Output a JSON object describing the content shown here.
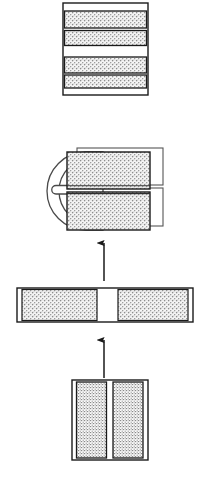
{
  "figure": {
    "background_color": "#ffffff",
    "line_color": "#1a1a1a",
    "hatch_color": "#9a9a9a",
    "fill_white": "#ffffff",
    "canvas": {
      "width": 208,
      "height": 492
    },
    "stages": [
      {
        "id": "stage-4-final-laminate",
        "order": 4,
        "name": "final-stacked-laminate",
        "position_label": "top",
        "shape": "rectangle",
        "x": 63,
        "y": 3,
        "width": 85,
        "height": 92,
        "bands": [
          {
            "name": "margin-top",
            "fill": "white",
            "y": 3,
            "height": 8
          },
          {
            "name": "hatched-band-1",
            "fill": "hatch",
            "y": 11,
            "height": 17
          },
          {
            "name": "divider-1",
            "fill": "line",
            "y": 28,
            "height": 2
          },
          {
            "name": "hatched-band-2",
            "fill": "hatch",
            "y": 30,
            "height": 15
          },
          {
            "name": "center-gap",
            "fill": "white",
            "y": 45,
            "height": 12
          },
          {
            "name": "hatched-band-3",
            "fill": "hatch",
            "y": 57,
            "height": 16
          },
          {
            "name": "divider-2",
            "fill": "line",
            "y": 73,
            "height": 2
          },
          {
            "name": "hatched-band-4",
            "fill": "hatch",
            "y": 75,
            "height": 13
          },
          {
            "name": "margin-bottom",
            "fill": "white",
            "y": 88,
            "height": 7
          }
        ]
      },
      {
        "id": "stage-3-clamped-assembly",
        "order": 3,
        "name": "u-clamp-with-two-blocks",
        "position_label": "upper-middle",
        "clamp": {
          "name": "u-shaped-bracket",
          "x": 47,
          "y": 152,
          "width": 56,
          "height": 78,
          "round_radius": 39,
          "slot": {
            "x": 55,
            "y": 185,
            "width": 48,
            "height": 9
          }
        },
        "blocks": [
          {
            "name": "upper-hatched-block",
            "x": 67,
            "y": 152,
            "width": 83,
            "height": 37
          },
          {
            "name": "lower-hatched-block",
            "x": 67,
            "y": 192,
            "width": 83,
            "height": 38
          }
        ],
        "backplates": [
          {
            "name": "upper-back-outline",
            "x": 77,
            "y": 148,
            "width": 86,
            "height": 37
          },
          {
            "name": "lower-back-outline",
            "x": 77,
            "y": 188,
            "width": 86,
            "height": 38
          }
        ]
      },
      {
        "id": "stage-2-split-bar",
        "order": 2,
        "name": "horizontal-split-bar",
        "position_label": "lower-middle",
        "shape": "rectangle",
        "x": 17,
        "y": 288,
        "width": 176,
        "height": 34,
        "segments": [
          {
            "name": "left-end-cap",
            "fill": "white",
            "x": 17,
            "width": 5
          },
          {
            "name": "left-hatched-segment",
            "fill": "hatch",
            "x": 22,
            "width": 75
          },
          {
            "name": "center-gap",
            "fill": "white",
            "x": 97,
            "width": 21
          },
          {
            "name": "right-hatched-segment",
            "fill": "hatch",
            "x": 118,
            "width": 70
          },
          {
            "name": "right-end-cap",
            "fill": "white",
            "x": 188,
            "width": 5
          }
        ]
      },
      {
        "id": "stage-1-paired-panels",
        "order": 1,
        "name": "paired-vertical-panels",
        "position_label": "bottom",
        "shape": "rectangle",
        "x": 72,
        "y": 380,
        "width": 76,
        "height": 80,
        "segments": [
          {
            "name": "left-end-cap",
            "fill": "white",
            "x": 72,
            "width": 4
          },
          {
            "name": "left-hatched-panel",
            "fill": "hatch",
            "x": 76,
            "width": 31
          },
          {
            "name": "center-gap",
            "fill": "white",
            "x": 107,
            "width": 6
          },
          {
            "name": "right-hatched-panel",
            "fill": "hatch",
            "x": 113,
            "width": 31
          },
          {
            "name": "right-end-cap",
            "fill": "white",
            "x": 144,
            "width": 4
          }
        ]
      }
    ],
    "arrows": [
      {
        "id": "arrow-stage2-to-stage3",
        "name": "upward-flow-arrow-upper",
        "direction": "up",
        "x": 104,
        "y_tail": 281,
        "y_head": 241,
        "from": "stage-2-split-bar",
        "to": "stage-3-clamped-assembly"
      },
      {
        "id": "arrow-stage1-to-stage2",
        "name": "upward-flow-arrow-lower",
        "direction": "up",
        "x": 104,
        "y_tail": 378,
        "y_head": 338,
        "from": "stage-1-paired-panels",
        "to": "stage-2-split-bar"
      }
    ]
  }
}
